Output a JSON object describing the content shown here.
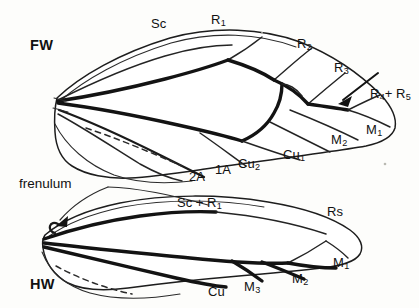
{
  "figure": {
    "background_color": "#fdfdfb",
    "ink_color": "#131313"
  },
  "wings": {
    "forewing": {
      "tag": "FW",
      "tag_full": "forewing"
    },
    "hindwing": {
      "tag": "HW",
      "tag_full": "hindwing"
    }
  },
  "annotations": {
    "frenulum": "frenulum"
  },
  "forewing_veins": [
    {
      "id": "sc",
      "base": "Sc",
      "sub": ""
    },
    {
      "id": "r1",
      "base": "R",
      "sub": "1"
    },
    {
      "id": "r2",
      "base": "R",
      "sub": "2"
    },
    {
      "id": "r3",
      "base": "R",
      "sub": "3"
    },
    {
      "id": "r45",
      "base": "R",
      "sub": "4",
      "base2": "+ R",
      "sub2": "5"
    },
    {
      "id": "m1",
      "base": "M",
      "sub": "1"
    },
    {
      "id": "m2",
      "base": "M",
      "sub": "2"
    },
    {
      "id": "cu1",
      "base": "Cu",
      "sub": "1"
    },
    {
      "id": "cu2",
      "base": "Cu",
      "sub": "2"
    },
    {
      "id": "a1",
      "base": "1A",
      "sub": ""
    },
    {
      "id": "a2",
      "base": "2A",
      "sub": ""
    }
  ],
  "hindwing_veins": [
    {
      "id": "hw_scr1",
      "base": "Sc + R",
      "sub": "1"
    },
    {
      "id": "hw_rs",
      "base": "Rs",
      "sub": ""
    },
    {
      "id": "hw_m1",
      "base": "M",
      "sub": "1"
    },
    {
      "id": "hw_m2",
      "base": "M",
      "sub": "2"
    },
    {
      "id": "hw_m3",
      "base": "M",
      "sub": "3"
    },
    {
      "id": "hw_cu",
      "base": "Cu",
      "sub": ""
    }
  ],
  "labels": {
    "fw_tag": "FW",
    "hw_tag": "HW",
    "frenulum": "frenulum",
    "sc": "Sc",
    "r1_base": "R",
    "r1_sub": "1",
    "r2_base": "R",
    "r2_sub": "2",
    "r3_base": "R",
    "r3_sub": "3",
    "r4_base": "R",
    "r4_sub": "4",
    "r5_base": "+ R",
    "r5_sub": "5",
    "m1_base": "M",
    "m1_sub": "1",
    "m2_base": "M",
    "m2_sub": "2",
    "cu1_base": "Cu",
    "cu1_sub": "1",
    "cu2_base": "Cu",
    "cu2_sub": "2",
    "a1": "1A",
    "a2": "2A",
    "hw_scr1_base": "Sc + R",
    "hw_scr1_sub": "1",
    "hw_rs": "Rs",
    "hw_m1_base": "M",
    "hw_m1_sub": "1",
    "hw_m2_base": "M",
    "hw_m2_sub": "2",
    "hw_m3_base": "M",
    "hw_m3_sub": "3",
    "hw_cu": "Cu"
  }
}
